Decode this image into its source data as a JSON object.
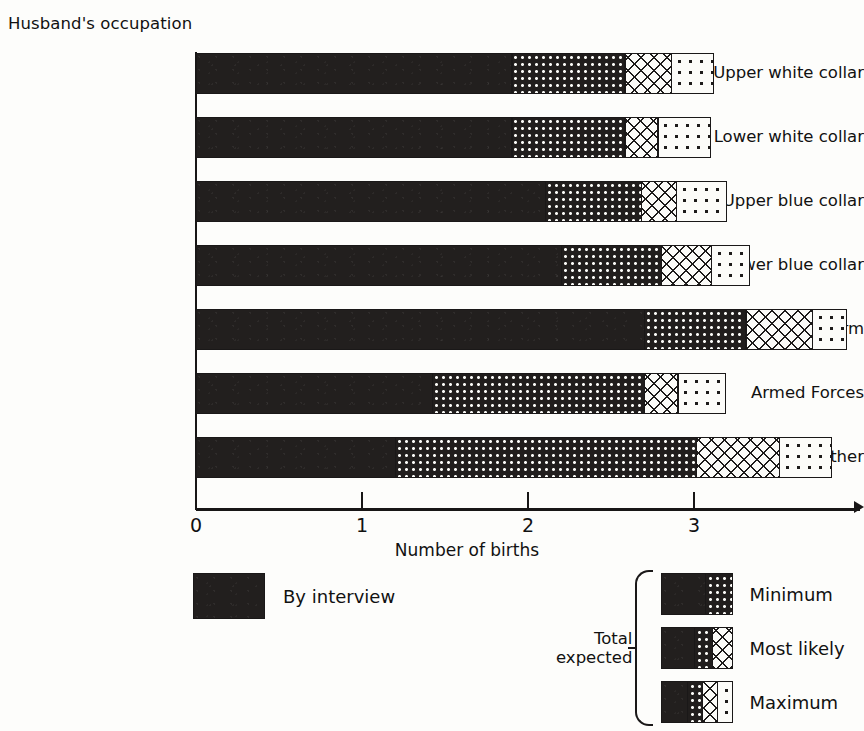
{
  "chart_data": {
    "type": "bar",
    "orientation": "horizontal",
    "stacked": "cumulative",
    "title": "Husband's occupation",
    "xlabel": "Number of births",
    "ylabel": "Husband's occupation",
    "xlim": [
      0,
      4.0
    ],
    "xticks": [
      0,
      1,
      2,
      3
    ],
    "xtick_labels": [
      "0",
      "1",
      "2",
      "3"
    ],
    "grid": false,
    "legend_position": "below-axes",
    "categories": [
      "Upper white collar",
      "Lower white collar",
      "Upper blue collar",
      "Lower blue collar",
      "Farm",
      "Armed Forces",
      "Other"
    ],
    "series": [
      {
        "name": "By interview",
        "pattern": "solid-black",
        "values": [
          1.9,
          1.9,
          2.1,
          2.2,
          2.7,
          1.42,
          1.2
        ]
      },
      {
        "name": "Minimum",
        "pattern": "dense-dots-on-black",
        "values": [
          2.58,
          2.58,
          2.68,
          2.8,
          3.31,
          2.7,
          3.01
        ]
      },
      {
        "name": "Most likely",
        "pattern": "cross-hatch",
        "values": [
          2.86,
          2.78,
          2.89,
          3.1,
          3.71,
          2.9,
          3.51
        ]
      },
      {
        "name": "Maximum",
        "pattern": "sparse-dots-on-white",
        "values": [
          3.12,
          3.1,
          3.2,
          3.34,
          3.92,
          3.19,
          3.83
        ]
      }
    ]
  },
  "legend": {
    "interview_label": "By interview",
    "total_expected_line1": "Total",
    "total_expected_line2": "expected",
    "rows": [
      {
        "label": "Minimum"
      },
      {
        "label": "Most likely"
      },
      {
        "label": "Maximum"
      }
    ]
  },
  "colors": {
    "ink": "#1a1818",
    "solid_fill": "#221f1e",
    "paper": "#fdfdfb"
  }
}
